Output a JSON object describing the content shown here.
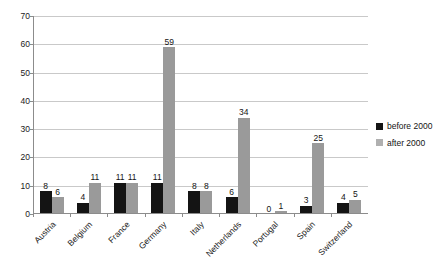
{
  "chart_data": {
    "type": "bar",
    "title": "",
    "subtitle": "",
    "xlabel": "",
    "ylabel": "",
    "ylim": [
      0,
      70
    ],
    "ytick_step": 10,
    "yticks": [
      0,
      10,
      20,
      30,
      40,
      50,
      60,
      70
    ],
    "grid": "horizontal",
    "legend_position": "right",
    "categories": [
      "Austria",
      "Belgium",
      "France",
      "Germany",
      "Italy",
      "Netherlands",
      "Portugal",
      "Spain",
      "Switzerland"
    ],
    "series": [
      {
        "name": "before 2000",
        "color": "#141414",
        "values": [
          8,
          4,
          11,
          11,
          8,
          6,
          0,
          3,
          4
        ]
      },
      {
        "name": "after 2000",
        "color": "#9a9a9a",
        "values": [
          6,
          11,
          11,
          59,
          8,
          34,
          1,
          25,
          5
        ]
      }
    ],
    "data_labels_shown": true
  },
  "legend": {
    "items": [
      {
        "label": "before 2000",
        "swatch": "black-square-icon"
      },
      {
        "label": "after 2000",
        "swatch": "gray-square-icon"
      }
    ]
  },
  "colors": {
    "before_2000": "#141414",
    "after_2000": "#9a9a9a",
    "gridline": "#c9c9c9",
    "axis": "#8c8c8c",
    "background": "#ffffff",
    "text": "#1a1a1a"
  }
}
